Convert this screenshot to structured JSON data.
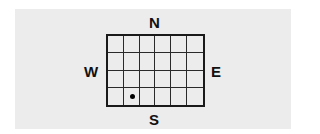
{
  "compass": {
    "north": "N",
    "south": "S",
    "east": "E",
    "west": "W"
  },
  "grid": {
    "columns": 6,
    "rows": 4,
    "marker": {
      "column": 2,
      "row": 4,
      "shape": "dot"
    }
  },
  "colors": {
    "panel_background": "#ececec",
    "line": "#1a1a1a",
    "marker": "#000000"
  }
}
